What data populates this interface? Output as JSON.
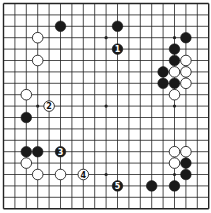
{
  "board": {
    "size": 19,
    "origin_px": [
      3.5,
      3.5
    ],
    "spacing_px": 11.4,
    "stone_radius_px": 5.3,
    "line_color": "#222222",
    "background": "#ffffff",
    "black_color": "#1a1a1a",
    "white_fill": "#ffffff",
    "white_stroke": "#222222",
    "star_points": [
      [
        3,
        3
      ],
      [
        9,
        3
      ],
      [
        15,
        3
      ],
      [
        3,
        9
      ],
      [
        9,
        9
      ],
      [
        15,
        9
      ],
      [
        3,
        15
      ],
      [
        9,
        15
      ],
      [
        15,
        15
      ]
    ]
  },
  "stones": [
    {
      "color": "black",
      "col": 5,
      "row": 2
    },
    {
      "color": "black",
      "col": 10,
      "row": 2
    },
    {
      "color": "black",
      "col": 10,
      "row": 4,
      "label": "1"
    },
    {
      "color": "black",
      "col": 16,
      "row": 3
    },
    {
      "color": "black",
      "col": 15,
      "row": 4
    },
    {
      "color": "black",
      "col": 15,
      "row": 5
    },
    {
      "color": "black",
      "col": 14,
      "row": 6
    },
    {
      "color": "black",
      "col": 14,
      "row": 7
    },
    {
      "color": "black",
      "col": 15,
      "row": 7
    },
    {
      "color": "white",
      "col": 3,
      "row": 3
    },
    {
      "color": "white",
      "col": 3,
      "row": 5
    },
    {
      "color": "white",
      "col": 2,
      "row": 8
    },
    {
      "color": "white",
      "col": 16,
      "row": 5
    },
    {
      "color": "white",
      "col": 15,
      "row": 6
    },
    {
      "color": "white",
      "col": 16,
      "row": 6
    },
    {
      "color": "white",
      "col": 16,
      "row": 7
    },
    {
      "color": "white",
      "col": 15,
      "row": 8
    },
    {
      "color": "white",
      "col": 4,
      "row": 9,
      "label": "2"
    },
    {
      "color": "black",
      "col": 2,
      "row": 10
    },
    {
      "color": "black",
      "col": 2,
      "row": 13
    },
    {
      "color": "black",
      "col": 3,
      "row": 13
    },
    {
      "color": "black",
      "col": 5,
      "row": 13,
      "label": "3"
    },
    {
      "color": "white",
      "col": 2,
      "row": 14
    },
    {
      "color": "white",
      "col": 3,
      "row": 15
    },
    {
      "color": "white",
      "col": 5,
      "row": 15
    },
    {
      "color": "white",
      "col": 7,
      "row": 15,
      "label": "4"
    },
    {
      "color": "white",
      "col": 15,
      "row": 13
    },
    {
      "color": "white",
      "col": 16,
      "row": 13
    },
    {
      "color": "white",
      "col": 15,
      "row": 14
    },
    {
      "color": "black",
      "col": 16,
      "row": 14
    },
    {
      "color": "black",
      "col": 16,
      "row": 15
    },
    {
      "color": "black",
      "col": 15,
      "row": 16
    },
    {
      "color": "black",
      "col": 13,
      "row": 16
    },
    {
      "color": "black",
      "col": 10,
      "row": 16,
      "label": "5"
    }
  ]
}
